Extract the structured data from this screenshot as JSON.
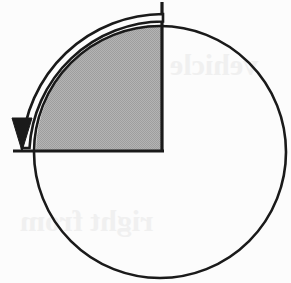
{
  "figure": {
    "background_color": "#fcfcfc",
    "stroke_color": "#1a1a1a",
    "shaded_fill_color": "#ababab",
    "width": 291,
    "height": 283
  },
  "geometry": {
    "circle": {
      "center_x": 160,
      "center_y": 152,
      "radius": 126,
      "stroke_width": 2.6,
      "fill": "none"
    },
    "sector": {
      "description": "shaded quarter region bounded by the vertical radius going up and the horizontal radius going left",
      "corner_x": 162,
      "corner_y": 151,
      "start_angle_deg": 90,
      "end_angle_deg": 180,
      "sweep_deg": 90,
      "fill": "#ababab"
    },
    "vertical_line": {
      "x": 162,
      "y_top": 2,
      "y_bottom": 152,
      "stroke_width": 3.2
    },
    "horizontal_line": {
      "y": 151,
      "x_left": 13,
      "x_right": 164,
      "stroke_width": 3.2
    },
    "arrow": {
      "description": "open outlined curved arrow sweeping counterclockwise from the top of the vertical radius around the outside of the circle to the left, terminating in a solid downward arrowhead at the horizontal radius",
      "direction": "counterclockwise",
      "tail_x": 163,
      "tail_y": 10,
      "head_tip_x": 22,
      "head_tip_y": 151,
      "band_width": 7.5,
      "sweep_deg": 90,
      "arc_radius": 142
    }
  },
  "labels": {
    "ghost_marks": [
      {
        "text": "vehicle",
        "x": 170,
        "y": 58,
        "size": 30
      },
      {
        "text": "right from",
        "x": 30,
        "y": 214,
        "size": 30
      }
    ]
  },
  "chart_data": {
    "type": "pie",
    "categories": [
      "Shaded quarter sector",
      "Unshaded remainder"
    ],
    "values": [
      25,
      75
    ],
    "value_unit": "percent",
    "colors": [
      "#ababab",
      "#fcfcfc"
    ],
    "annotations": [
      "Counterclockwise arrow spanning 90 degrees",
      "Arrowhead points downward at the left end of the horizontal radius"
    ],
    "legend": "none",
    "grid": false
  }
}
